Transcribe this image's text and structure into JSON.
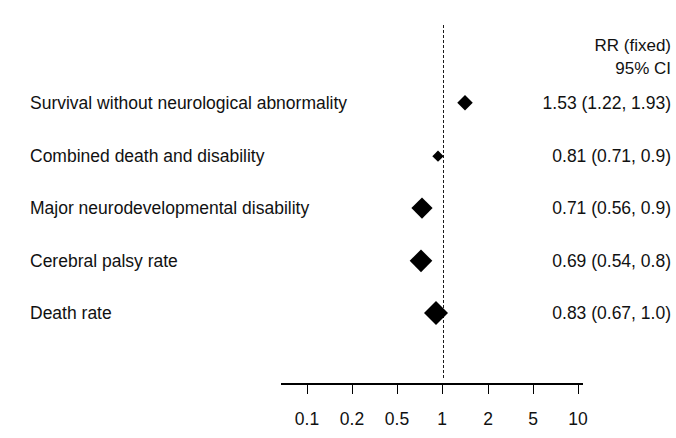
{
  "figure": {
    "background_color": "#ffffff",
    "ink_color": "#000000"
  },
  "header": {
    "line1": "RR (fixed)",
    "line2": "95% CI"
  },
  "axis": {
    "tick_labels": [
      "0.1",
      "0.2",
      "0.5",
      "1",
      "2",
      "5",
      "10"
    ],
    "tick_values": [
      0.1,
      0.2,
      0.5,
      1,
      2,
      5,
      10
    ],
    "scale": "log",
    "line_y": 383,
    "line_x_start": 281,
    "line_x_end": 583,
    "label_y": 409,
    "tick_pixels": [
      307,
      352,
      397,
      442,
      488,
      533,
      578
    ]
  },
  "reference_line": {
    "value": 1,
    "x": 443,
    "style": "dashed"
  },
  "rows": [
    {
      "label": "Survival without neurological abnormality",
      "value_text": "1.53 (1.22, 1.93)",
      "y": 103,
      "marker_x": 465,
      "marker_size": 16
    },
    {
      "label": "Combined death and disability",
      "value_text": "0.81 (0.71, 0.9)",
      "y": 156,
      "marker_x": 438,
      "marker_size": 11
    },
    {
      "label": "Major neurodevelopmental disability",
      "value_text": "0.71 (0.56, 0.9)",
      "y": 208,
      "marker_x": 422,
      "marker_size": 21
    },
    {
      "label": "Cerebral palsy rate",
      "value_text": "0.69 (0.54, 0.8)",
      "y": 261,
      "marker_x": 421,
      "marker_size": 23
    },
    {
      "label": "Death rate",
      "value_text": "0.83 (0.67, 1.0)",
      "y": 313,
      "marker_x": 436,
      "marker_size": 24
    }
  ],
  "chart_data": {
    "type": "scatter",
    "chart_subtype": "forest-plot",
    "title": "",
    "xlabel": "",
    "ylabel": "",
    "xscale": "log",
    "xlim": [
      0.09,
      11
    ],
    "grid": false,
    "legend": null,
    "effect_measure": "RR (fixed)",
    "ci_level": "95% CI",
    "reference_value": 1,
    "xticks": [
      0.1,
      0.2,
      0.5,
      1,
      2,
      5,
      10
    ],
    "xticklabels": [
      "0.1",
      "0.2",
      "0.5",
      "1",
      "2",
      "5",
      "10"
    ],
    "categories": [
      "Survival without neurological abnormality",
      "Combined death and disability",
      "Major neurodevelopmental disability",
      "Cerebral palsy rate",
      "Death rate"
    ],
    "point_estimates": [
      1.53,
      0.81,
      0.71,
      0.69,
      0.83
    ],
    "ci_lower": [
      1.22,
      0.71,
      0.56,
      0.54,
      0.67
    ],
    "ci_upper": [
      1.93,
      0.9,
      0.9,
      0.8,
      1.0
    ],
    "annotations": [
      "1.53 (1.22, 1.93)",
      "0.81 (0.71, 0.9)",
      "0.71 (0.56, 0.9)",
      "0.69 (0.54, 0.8)",
      "0.83 (0.67, 1.0)"
    ]
  }
}
